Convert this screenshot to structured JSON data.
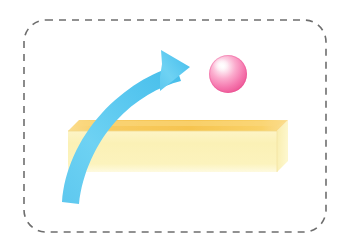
{
  "figure": {
    "background_color": "#ffffff",
    "width": 350,
    "height": 251
  },
  "border": {
    "name": "dashed-rounded-frame",
    "style": "dashed",
    "color": "#6e6e6e",
    "stroke_width": 1.6,
    "dash_pattern": "7 6",
    "corner_radius": 22,
    "x": 24,
    "y": 20,
    "width": 302,
    "height": 212
  },
  "arrow": {
    "name": "curved-motion-arrow",
    "color_light": "#7fd4f2",
    "color_main": "#4fc4ee",
    "color_dark": "#2fb7e8",
    "direction": "up-right",
    "tail_x": 62,
    "tail_y": 202,
    "tip_x": 188,
    "tip_y": 65,
    "label": "trajectory"
  },
  "slab": {
    "name": "yellow-platform",
    "top_face_color": "#f7c655",
    "top_face_color_light": "#fbd97f",
    "front_face_color": "#fbf2b8",
    "front_face_color_light": "#fdf8d8",
    "side_face_color": "#f8eaa0",
    "edge_color": "#f0d98a",
    "front_left_x": 68,
    "front_top_y": 131,
    "front_bottom_y": 172,
    "right_x": 277,
    "back_offset_x": 11,
    "back_offset_y": 11,
    "label": "platform"
  },
  "ball": {
    "name": "pink-sphere",
    "center_x": 228,
    "center_y": 74,
    "radius": 19,
    "color_core": "#ffffff",
    "color_mid": "#fba8c8",
    "color_edge": "#ef5f99",
    "color_rim": "#e84b8c",
    "highlight_x": 221,
    "highlight_y": 65,
    "label": "ball"
  },
  "accessibility": {
    "description": "A light blue curved arrow arcs upward from the lower left, crossing a pale yellow three dimensional slab, and points toward the upper right where a glossy pink sphere floats. The whole illustration sits inside a gray dashed rounded rectangle."
  }
}
